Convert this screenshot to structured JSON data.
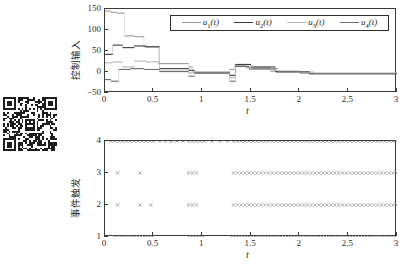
{
  "figure": {
    "qr_code": {
      "label": "qr-code"
    },
    "panels": [
      {
        "id": "top",
        "ylabel": "控制输入",
        "xlabel": "t",
        "yticks": [
          "-50",
          "0",
          "50",
          "100",
          "150"
        ],
        "xticks": [
          "0",
          "0.5",
          "1",
          "1.5",
          "2",
          "2.5",
          "3"
        ]
      },
      {
        "id": "bottom",
        "ylabel": "事件触发",
        "xlabel": "t",
        "yticks": [
          "1",
          "2",
          "3",
          "4"
        ],
        "xticks": [
          "0",
          "0.5",
          "1",
          "1.5",
          "2",
          "2.5",
          "3"
        ]
      }
    ],
    "legend": [
      {
        "label": "u1(t)",
        "sym": "u",
        "sub": "1",
        "color": "#9a9a9a"
      },
      {
        "label": "u2(t)",
        "sym": "u",
        "sub": "2",
        "color": "#3b3b3b"
      },
      {
        "label": "u3(t)",
        "sym": "u",
        "sub": "3",
        "color": "#b3b3b3"
      },
      {
        "label": "u4(t)",
        "sym": "u",
        "sub": "4",
        "color": "#6e6e6e"
      }
    ]
  },
  "chart_data": [
    {
      "type": "line",
      "id": "control-input",
      "title": "",
      "xlabel": "t",
      "ylabel": "控制输入",
      "xlim": [
        0,
        3
      ],
      "ylim": [
        -50,
        150
      ],
      "xticks": [
        0,
        0.5,
        1,
        1.5,
        2,
        2.5,
        3
      ],
      "yticks": [
        -50,
        0,
        50,
        100,
        150
      ],
      "grid": false,
      "legend_position": "top-center",
      "note": "piecewise-constant (zero-order-hold) event-triggered control signals",
      "series": [
        {
          "name": "u1(t)",
          "color": "#9a9a9a",
          "steps": [
            [
              0.0,
              0.06,
              145
            ],
            [
              0.06,
              0.12,
              142
            ],
            [
              0.12,
              0.2,
              140
            ],
            [
              0.2,
              0.3,
              86
            ],
            [
              0.3,
              0.4,
              84
            ],
            [
              0.4,
              0.55,
              60
            ],
            [
              0.55,
              0.86,
              20
            ],
            [
              0.86,
              0.9,
              12
            ],
            [
              0.9,
              1.28,
              0
            ],
            [
              1.28,
              1.33,
              6
            ],
            [
              1.33,
              1.45,
              16
            ],
            [
              1.45,
              1.7,
              10
            ],
            [
              1.7,
              2.0,
              2
            ],
            [
              2.0,
              3.0,
              -3
            ]
          ]
        },
        {
          "name": "u2(t)",
          "color": "#3b3b3b",
          "steps": [
            [
              0.0,
              0.08,
              42
            ],
            [
              0.08,
              0.18,
              64
            ],
            [
              0.18,
              0.3,
              58
            ],
            [
              0.3,
              0.42,
              62
            ],
            [
              0.42,
              0.56,
              60
            ],
            [
              0.56,
              0.86,
              8
            ],
            [
              0.86,
              0.92,
              4
            ],
            [
              0.92,
              1.28,
              -2
            ],
            [
              1.28,
              1.34,
              -8
            ],
            [
              1.34,
              1.5,
              18
            ],
            [
              1.5,
              1.75,
              12
            ],
            [
              1.75,
              2.1,
              1
            ],
            [
              2.1,
              3.0,
              -4
            ]
          ]
        },
        {
          "name": "u3(t)",
          "color": "#b3b3b3",
          "steps": [
            [
              0.0,
              0.08,
              22
            ],
            [
              0.08,
              0.18,
              24
            ],
            [
              0.18,
              0.3,
              12
            ],
            [
              0.3,
              0.42,
              26
            ],
            [
              0.42,
              0.56,
              24
            ],
            [
              0.56,
              0.86,
              2
            ],
            [
              0.86,
              0.92,
              -2
            ],
            [
              0.92,
              1.28,
              -1
            ],
            [
              1.28,
              1.34,
              -14
            ],
            [
              1.34,
              1.52,
              14
            ],
            [
              1.52,
              1.78,
              8
            ],
            [
              1.78,
              2.15,
              0
            ],
            [
              2.15,
              3.0,
              -3
            ]
          ]
        },
        {
          "name": "u4(t)",
          "color": "#6e6e6e",
          "steps": [
            [
              0.0,
              0.06,
              -18
            ],
            [
              0.06,
              0.14,
              -22
            ],
            [
              0.14,
              0.26,
              6
            ],
            [
              0.26,
              0.4,
              8
            ],
            [
              0.4,
              0.56,
              6
            ],
            [
              0.56,
              0.86,
              1
            ],
            [
              0.86,
              0.92,
              -10
            ],
            [
              0.92,
              1.28,
              -2
            ],
            [
              1.28,
              1.34,
              -22
            ],
            [
              1.34,
              1.48,
              13
            ],
            [
              1.48,
              1.76,
              7
            ],
            [
              1.76,
              2.1,
              0
            ],
            [
              2.1,
              3.0,
              -4
            ]
          ]
        }
      ]
    },
    {
      "type": "scatter",
      "id": "event-trigger",
      "title": "",
      "xlabel": "t",
      "ylabel": "事件触发",
      "xlim": [
        0,
        3
      ],
      "ylim": [
        1,
        4
      ],
      "xticks": [
        0,
        0.5,
        1,
        1.5,
        2,
        2.5,
        3
      ],
      "yticks": [
        1,
        2,
        3,
        4
      ],
      "grid": false,
      "marker": "x",
      "note": "event-triggering instants for 4 agents; row value = agent index",
      "series": [
        {
          "name": "agent-1",
          "y": 1,
          "color": "#707070",
          "x": [
            0.1,
            0.13,
            0.16,
            0.19,
            0.22,
            0.25,
            0.28,
            0.31,
            0.34,
            0.37,
            0.4,
            0.43,
            0.46,
            0.49,
            0.86,
            0.89,
            0.92,
            0.95,
            0.98,
            1.01,
            1.3,
            1.33,
            1.36,
            1.39,
            1.42,
            1.45,
            1.48,
            1.51,
            1.54,
            1.57,
            1.6,
            1.63,
            1.66,
            1.69,
            1.72,
            1.75,
            1.78,
            1.81,
            1.84,
            1.87,
            1.9,
            1.93,
            1.96,
            1.99,
            2.02,
            2.05,
            2.08,
            2.11,
            2.14,
            2.17,
            2.2,
            2.23,
            2.26,
            2.29,
            2.32,
            2.35,
            2.38,
            2.41,
            2.44,
            2.47,
            2.5,
            2.53,
            2.56,
            2.59,
            2.62,
            2.65,
            2.68,
            2.71,
            2.74,
            2.77,
            2.8,
            2.83,
            2.86,
            2.89,
            2.92,
            2.95,
            2.98
          ]
        },
        {
          "name": "agent-2",
          "y": 2,
          "color": "#8c8c8c",
          "x": [
            0.13,
            0.36,
            0.47,
            0.86,
            0.9,
            0.94,
            1.32,
            1.36,
            1.4,
            1.44,
            1.48,
            1.52,
            1.56,
            1.6,
            1.64,
            1.68,
            1.72,
            1.76,
            1.8,
            1.84,
            1.88,
            1.92,
            1.96,
            2.0,
            2.04,
            2.08,
            2.12,
            2.16,
            2.2,
            2.24,
            2.28,
            2.32,
            2.36,
            2.4,
            2.44,
            2.48,
            2.52,
            2.56,
            2.6,
            2.64,
            2.68,
            2.72,
            2.76,
            2.8,
            2.84,
            2.88,
            2.92,
            2.96,
            3.0
          ]
        },
        {
          "name": "agent-3",
          "y": 3,
          "color": "#8c8c8c",
          "x": [
            0.13,
            0.36,
            0.86,
            0.9,
            0.94,
            1.32,
            1.36,
            1.4,
            1.44,
            1.48,
            1.52,
            1.56,
            1.6,
            1.64,
            1.68,
            1.72,
            1.76,
            1.8,
            1.84,
            1.88,
            1.92,
            1.96,
            2.0,
            2.04,
            2.08,
            2.12,
            2.16,
            2.2,
            2.24,
            2.28,
            2.32,
            2.36,
            2.4,
            2.44,
            2.48,
            2.52,
            2.56,
            2.6,
            2.64,
            2.68,
            2.72,
            2.76,
            2.8,
            2.84,
            2.88,
            2.92,
            2.96,
            3.0
          ]
        },
        {
          "name": "agent-4",
          "y": 4,
          "color": "#707070",
          "x": [
            0.06,
            0.1,
            0.14,
            0.18,
            0.22,
            0.26,
            0.3,
            0.34,
            0.38,
            0.42,
            0.46,
            0.5,
            0.56,
            0.62,
            0.68,
            0.74,
            0.8,
            0.86,
            0.9,
            0.94,
            0.98,
            1.02,
            1.1,
            1.18,
            1.26,
            1.32,
            1.36,
            1.4,
            1.44,
            1.48,
            1.52,
            1.56,
            1.6,
            1.64,
            1.68,
            1.72,
            1.76,
            1.8,
            1.84,
            1.88,
            1.92,
            1.96,
            2.0,
            2.04,
            2.08,
            2.12,
            2.16,
            2.2,
            2.24,
            2.28,
            2.32,
            2.36,
            2.4,
            2.44,
            2.48,
            2.52,
            2.56,
            2.6,
            2.64,
            2.68,
            2.72,
            2.76,
            2.8,
            2.84,
            2.88,
            2.92,
            2.96,
            3.0
          ]
        }
      ]
    }
  ]
}
